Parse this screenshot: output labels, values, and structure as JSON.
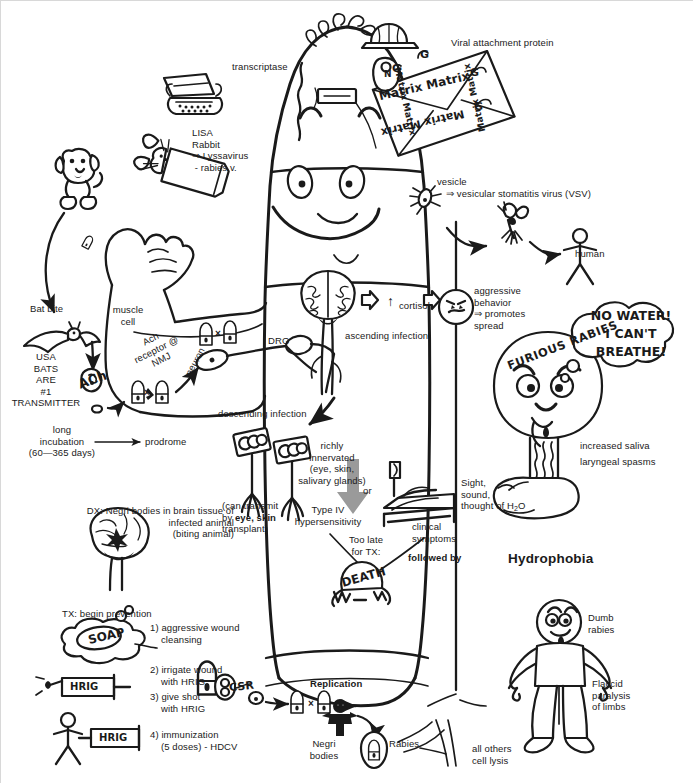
{
  "meta": {
    "width": 693,
    "height": 783,
    "ink": "#1a1a1a",
    "gray_arrow": "#9a9a9a"
  },
  "labels": {
    "transcriptase": "transcriptase",
    "viral_attachment_protein": "Viral attachment protein",
    "matrix_text": "Matrix Matrix",
    "g_spike": "G",
    "n_protein": "N",
    "lisa": "LISA\nRabbit\n⇒ Lyssavirus\n - rabies v.",
    "vesicle": "vesicle",
    "vesicle_sub": "⇒ vesicular stomatitis virus (VSV)",
    "human": "human",
    "bat_bite": "Bat bite",
    "usa_bats": "USA\nBATS\nARE\n#1\nTRANSMITTER",
    "muscle_cell": "muscle\ncell",
    "ach_receptor": "Ach\nreceptor @\nNMJ",
    "ach": "ACh",
    "neuron": "neuron",
    "drg": "DRG",
    "ascending_infection": "ascending infection",
    "cortisol": "cortisol",
    "cortisol_arrow": "↑",
    "aggressive_behavior": "aggressive\nbehavior\n⇒ promotes\nspread",
    "furious_rabies": "FURIOUS RABIES",
    "speech_bubble": "NO WATER!\nI CAN'T\nBREATHE!",
    "increased_saliva": "increased saliva",
    "laryngeal_spasms": "laryngeal spasms",
    "sight_sound": "Sight,\nsound,\nthought of H",
    "sight_sound_sub": "2",
    "sight_sound_tail": "O",
    "hydrophobia": "Hydrophobia",
    "long_incubation": "long\nincubation\n(60—365 days)",
    "prodrome": "prodrome",
    "descending_infection": "descending infection",
    "richly_innervated": "richly\ninnervated\n(eye, skin,\nsalivary glands)",
    "can_transmit_1": "(can transmit",
    "can_transmit_2a": "by ",
    "can_transmit_2b": "eye, skin",
    "can_transmit_3": "transplant)",
    "type_iv": "Type IV\nhypersensitivity",
    "or": "or",
    "clinical_symptoms": "clinical\nsymptoms",
    "followed_by": "followed by",
    "too_late": "Too late\nfor TX:",
    "death": "DEATH",
    "dx_negri": "DX: Negri bodies in brain tissue of\ninfected animal\n(biting animal)",
    "tx_begin": "TX: begin prevention",
    "tx_soap": "SOAP",
    "tx_1": "1) aggressive wound\n    cleansing",
    "tx_2": "2) irrigate wound\n    with HRIG",
    "tx_3": "3) give shot\n    with HRIG",
    "tx_4": "4) immunization\n    (5 doses) - HDCV",
    "hrig": "HRIG",
    "replication": "Replication",
    "csr": "CSR",
    "negri_bodies": "Negri\nbodies",
    "rabies": "Rabies",
    "all_others": "all others\ncell lysis",
    "dumb_rabies": "Dumb\nrabies",
    "flaccid": "Flaccid\nparalysis\nof limbs"
  },
  "diagram": {
    "type": "concept-mnemonic-sketch",
    "nodes": [
      "transcriptase (typewriter = RNA-dependent RNA polymerase)",
      "Matrix envelope (letter/envelope = M protein)",
      "G spikes (viral attachment protein)",
      "LISA Rabbit = Lyssavirus / rabies virus",
      "vesicle = vesicular stomatitis virus (VSV) → mosquito → human",
      "Bat bite — USA bats are #1 transmitter",
      "muscle cell, ACh receptor @ NMJ, neuron",
      "DRG → ascending infection → brain → ↑ cortisol → aggressive behavior",
      "FURIOUS RABIES: increased saliva, laryngeal spasms, hydrophobia",
      "descending infection → richly innervated (eye, skin, salivary glands)",
      "Type IV hypersensitivity → clinical symptoms → DEATH",
      "DX: Negri bodies in brain tissue of infected (biting) animal",
      "TX: wound cleansing, HRIG irrigation, HRIG shot, HDCV immunization",
      "Replication → CSR → Negri bodies → Rabies; all others cell lysis",
      "Dumb rabies: flaccid paralysis of limbs"
    ]
  }
}
